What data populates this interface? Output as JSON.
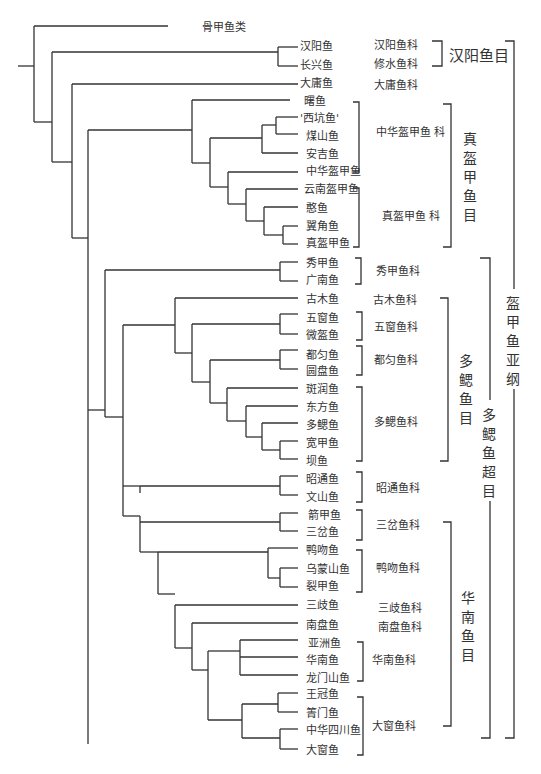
{
  "figure": {
    "type": "cladogram",
    "line_color": "#333333"
  },
  "outgroup": {
    "label": "骨甲鱼类"
  },
  "taxa": [
    {
      "id": "hanyang",
      "label": "汉阳鱼"
    },
    {
      "id": "changxing",
      "label": "长兴鱼"
    },
    {
      "id": "dayong",
      "label": "大庸鱼"
    },
    {
      "id": "shu",
      "label": "曙鱼"
    },
    {
      "id": "xikeng",
      "label": "'西坑鱼'"
    },
    {
      "id": "meishan",
      "label": "煤山鱼"
    },
    {
      "id": "anji",
      "label": "安吉鱼"
    },
    {
      "id": "sinogaleaspis",
      "label": "中华盔甲鱼"
    },
    {
      "id": "yunnan",
      "label": "云南盔甲鱼"
    },
    {
      "id": "han",
      "label": "憨鱼"
    },
    {
      "id": "yijiao",
      "label": "翼角鱼"
    },
    {
      "id": "zhenkui",
      "label": "真盔甲鱼"
    },
    {
      "id": "xiujia",
      "label": "秀甲鱼"
    },
    {
      "id": "guangnan",
      "label": "广南鱼"
    },
    {
      "id": "gumu",
      "label": "古木鱼"
    },
    {
      "id": "wuchuang",
      "label": "五窗鱼"
    },
    {
      "id": "weikui",
      "label": "微盔鱼"
    },
    {
      "id": "duyun",
      "label": "都匀鱼"
    },
    {
      "id": "yuanpan",
      "label": "圆盘鱼"
    },
    {
      "id": "banrun",
      "label": "斑润鱼"
    },
    {
      "id": "dongfang",
      "label": "东方鱼"
    },
    {
      "id": "duosai",
      "label": "多鳃鱼"
    },
    {
      "id": "kuanjia",
      "label": "宽甲鱼"
    },
    {
      "id": "ba",
      "label": "坝鱼"
    },
    {
      "id": "zhaotong",
      "label": "昭通鱼"
    },
    {
      "id": "wenshan",
      "label": "文山鱼"
    },
    {
      "id": "jianjia",
      "label": "箭甲鱼"
    },
    {
      "id": "sancha",
      "label": "三岔鱼"
    },
    {
      "id": "yawen",
      "label": "鸭吻鱼"
    },
    {
      "id": "wumengshan",
      "label": "乌蒙山鱼"
    },
    {
      "id": "liejia",
      "label": "裂甲鱼"
    },
    {
      "id": "sanqi",
      "label": "三歧鱼"
    },
    {
      "id": "nanpan",
      "label": "南盘鱼"
    },
    {
      "id": "yazhou",
      "label": "亚洲鱼"
    },
    {
      "id": "huanan",
      "label": "华南鱼"
    },
    {
      "id": "longmenshan",
      "label": "龙门山鱼"
    },
    {
      "id": "wangguan",
      "label": "王冠鱼"
    },
    {
      "id": "zhumen",
      "label": "箐门鱼"
    },
    {
      "id": "zhonghuasichuan",
      "label": "中华四川鱼"
    },
    {
      "id": "dachuang",
      "label": "大窗鱼"
    }
  ],
  "families": [
    {
      "label": "汉阳鱼科"
    },
    {
      "label": "修水鱼科"
    },
    {
      "label": "大庸鱼科"
    },
    {
      "label": "中华盔甲鱼 科"
    },
    {
      "label": "真盔甲鱼 科"
    },
    {
      "label": "秀甲鱼科"
    },
    {
      "label": "古木鱼科"
    },
    {
      "label": "五窗鱼科"
    },
    {
      "label": "都匀鱼科"
    },
    {
      "label": "多鳃鱼科"
    },
    {
      "label": "昭通鱼科"
    },
    {
      "label": "三岔鱼科"
    },
    {
      "label": "鸭吻鱼科"
    },
    {
      "label": "三歧鱼科"
    },
    {
      "label": "南盘鱼科"
    },
    {
      "label": "华南鱼科"
    },
    {
      "label": "大窗鱼科"
    }
  ],
  "orders": [
    {
      "label": "汉阳鱼目"
    },
    {
      "label": "真盔甲鱼目"
    },
    {
      "label": "多鳃鱼目"
    },
    {
      "label": "华南鱼目"
    }
  ],
  "superorder": {
    "label": "多鳃鱼超目"
  },
  "subclass": {
    "label": "盔甲鱼亚纲"
  }
}
